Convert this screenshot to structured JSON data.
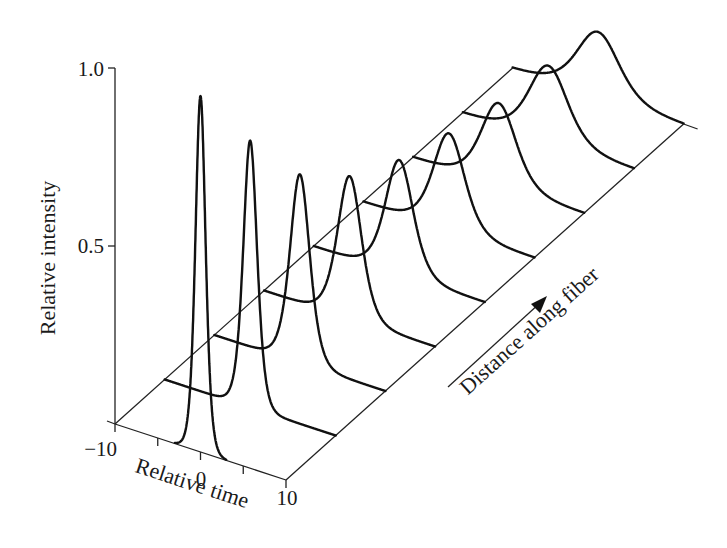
{
  "chart_data": {
    "type": "line",
    "subtype": "3d-waterfall",
    "title": "",
    "xlabel": "Relative time",
    "ylabel": "Relative intensity",
    "zlabel": "Distance along fiber",
    "x_ticks": [
      -10,
      -5,
      0,
      5,
      10
    ],
    "x_tick_labels": [
      "−10",
      "0",
      "10"
    ],
    "x_tick_label_values": [
      -10,
      0,
      10
    ],
    "y_ticks": [
      0.5,
      1.0
    ],
    "y_tick_labels": [
      "0.5",
      "1.0"
    ],
    "xlim": [
      -10,
      10
    ],
    "ylim": [
      0,
      1.0
    ],
    "zlim": [
      0,
      1.0
    ],
    "grid": false,
    "legend": null,
    "series": [
      {
        "name": "pulse-1",
        "distance": 0.0,
        "peak": 1.0,
        "fwhm": 1.4
      },
      {
        "name": "pulse-2",
        "distance": 0.125,
        "peak": 0.75,
        "fwhm": 1.9
      },
      {
        "name": "pulse-3",
        "distance": 0.25,
        "peak": 0.53,
        "fwhm": 2.7
      },
      {
        "name": "pulse-4",
        "distance": 0.375,
        "peak": 0.4,
        "fwhm": 3.3
      },
      {
        "name": "pulse-5",
        "distance": 0.5,
        "peak": 0.32,
        "fwhm": 3.8
      },
      {
        "name": "pulse-6",
        "distance": 0.625,
        "peak": 0.27,
        "fwhm": 4.3
      },
      {
        "name": "pulse-7",
        "distance": 0.75,
        "peak": 0.23,
        "fwhm": 4.8
      },
      {
        "name": "pulse-8",
        "distance": 0.875,
        "peak": 0.21,
        "fwhm": 5.3
      },
      {
        "name": "pulse-9",
        "distance": 1.0,
        "peak": 0.18,
        "fwhm": 5.8
      }
    ]
  },
  "labels": {
    "y_title": "Relative intensity",
    "x_title": "Relative time",
    "z_title": "Distance along fiber",
    "y_tick_1": "1.0",
    "y_tick_05": "0.5",
    "x_tick_min": "−10",
    "x_tick_mid": "0",
    "x_tick_max": "10"
  },
  "projection": {
    "origin": [
      115,
      424
    ],
    "time_unit": [
      8.55,
      2.8
    ],
    "fiber_unit": [
      397.6,
      -356
    ],
    "intensity_unit": 356
  }
}
